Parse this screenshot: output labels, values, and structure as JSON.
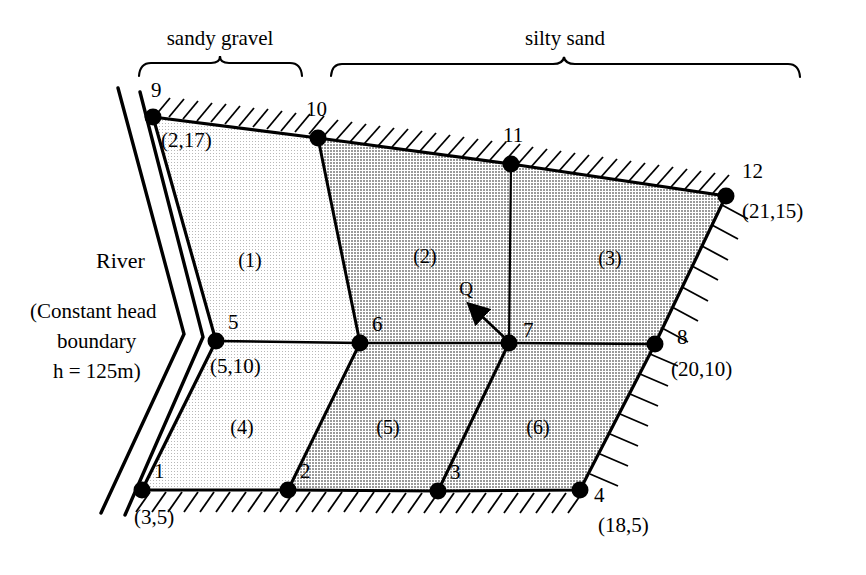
{
  "figure": {
    "materials": [
      {
        "id": "sandy-gravel",
        "label": "sandy gravel",
        "fill": "#f0f0f0",
        "brace_x1": 138,
        "brace_x2": 302,
        "label_x": 220,
        "label_y": 45
      },
      {
        "id": "silty-sand",
        "label": "silty sand",
        "fill": "#d5d5d5",
        "brace_x1": 330,
        "brace_x2": 800,
        "label_x": 565,
        "label_y": 45
      }
    ],
    "river": {
      "name": "River",
      "condition_line1": "(Constant head",
      "condition_line2": "boundary",
      "condition_line3": "h = 125m)",
      "name_x": 96,
      "name_y": 268,
      "cond_x": 30,
      "cond_y": 318
    },
    "flux": {
      "label": "Q",
      "label_x": 466,
      "label_y": 295,
      "arrow_from_x": 505,
      "arrow_from_y": 338,
      "arrow_to_x": 470,
      "arrow_to_y": 305
    },
    "nodes": [
      {
        "num": "1",
        "coord": "(3,5)",
        "x": 142,
        "y": 490,
        "num_dx": 12,
        "num_dy": -12,
        "coord_dx": -8,
        "coord_dy": 34
      },
      {
        "num": "2",
        "coord": "",
        "x": 288,
        "y": 490,
        "num_dx": 12,
        "num_dy": -12,
        "coord_dx": 0,
        "coord_dy": 0
      },
      {
        "num": "3",
        "coord": "",
        "x": 438,
        "y": 491,
        "num_dx": 12,
        "num_dy": -12,
        "coord_dx": 0,
        "coord_dy": 0
      },
      {
        "num": "4",
        "coord": "(18,5)",
        "x": 580,
        "y": 490,
        "num_dx": 14,
        "num_dy": 12,
        "coord_dx": 18,
        "coord_dy": 42
      },
      {
        "num": "5",
        "coord": "(5,10)",
        "x": 216,
        "y": 341,
        "num_dx": 12,
        "num_dy": -12,
        "coord_dx": -6,
        "coord_dy": 32
      },
      {
        "num": "6",
        "coord": "",
        "x": 360,
        "y": 343,
        "num_dx": 12,
        "num_dy": -12,
        "coord_dx": 0,
        "coord_dy": 0
      },
      {
        "num": "7",
        "coord": "",
        "x": 509,
        "y": 343,
        "num_dx": 14,
        "num_dy": -6,
        "coord_dx": 0,
        "coord_dy": 0
      },
      {
        "num": "8",
        "coord": "(20,10)",
        "x": 655,
        "y": 344,
        "num_dx": 22,
        "num_dy": 0,
        "coord_dx": 16,
        "coord_dy": 32
      },
      {
        "num": "9",
        "coord": "(2,17)",
        "x": 153,
        "y": 117,
        "num_dx": 4,
        "num_dy": -20,
        "coord_dx": 8,
        "coord_dy": 30
      },
      {
        "num": "10",
        "coord": "",
        "x": 318,
        "y": 138,
        "num_dx": -6,
        "num_dy": -22,
        "coord_dx": 0,
        "coord_dy": 0
      },
      {
        "num": "11",
        "coord": "",
        "x": 511,
        "y": 164,
        "num_dx": -4,
        "num_dy": -22,
        "coord_dx": 0,
        "coord_dy": 0
      },
      {
        "num": "12",
        "coord": "(21,15)",
        "x": 726,
        "y": 196,
        "num_dx": 16,
        "num_dy": -18,
        "coord_dx": 16,
        "coord_dy": 22
      }
    ],
    "elements": [
      {
        "label": "(1)",
        "x": 250,
        "y": 267,
        "material": "sandy-gravel"
      },
      {
        "label": "(2)",
        "x": 425,
        "y": 263,
        "material": "silty-sand"
      },
      {
        "label": "(3)",
        "x": 610,
        "y": 265,
        "material": "silty-sand"
      },
      {
        "label": "(4)",
        "x": 242,
        "y": 434,
        "material": "sandy-gravel"
      },
      {
        "label": "(5)",
        "x": 388,
        "y": 434,
        "material": "silty-sand"
      },
      {
        "label": "(6)",
        "x": 538,
        "y": 434,
        "material": "silty-sand"
      }
    ]
  }
}
